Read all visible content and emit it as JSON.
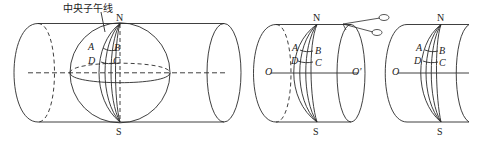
{
  "diagram": {
    "type": "gauss-kruger-projection-illustration",
    "panels": [
      {
        "id": "panel-1",
        "description": "Sphere inside a transverse cylinder tangent along the central meridian",
        "labels": {
          "central_meridian": "中央子午线",
          "north": "N",
          "south": "S",
          "a": "A",
          "b": "B",
          "c": "C",
          "d": "D"
        }
      },
      {
        "id": "panel-2",
        "description": "Cylinder with projected zone, axis O–O', scissors cutting along the generatrix",
        "labels": {
          "north": "N",
          "south": "S",
          "a": "A",
          "b": "B",
          "c": "C",
          "d": "D",
          "o": "O",
          "o_prime": "O'"
        },
        "icon": "scissors-icon"
      },
      {
        "id": "panel-3",
        "description": "Cylinder being unrolled into a plane",
        "labels": {
          "north": "N",
          "south": "S",
          "a": "A",
          "b": "B",
          "c": "C",
          "d": "D",
          "o": "O"
        }
      }
    ],
    "colors": {
      "stroke": "#2a2a2a",
      "text": "#222222",
      "background": "#ffffff"
    }
  }
}
